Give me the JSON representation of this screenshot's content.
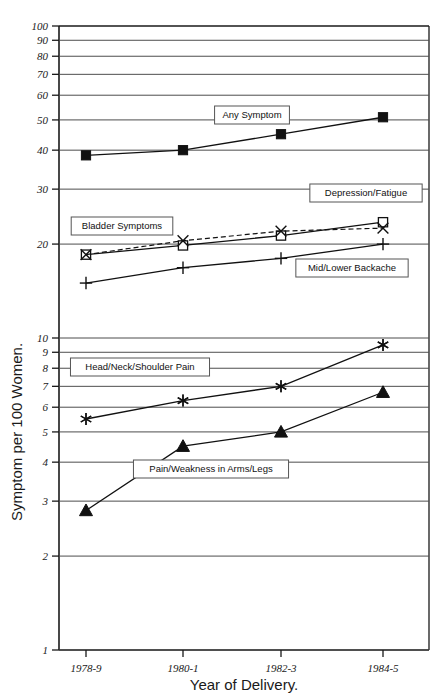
{
  "chart_data": {
    "type": "line",
    "title": "",
    "xlabel": "Year of Delivery.",
    "ylabel": "Symptom per 100 Women.",
    "yscale": "log",
    "ylim": [
      1,
      100
    ],
    "ytick_labels": [
      "100",
      "90",
      "80",
      "70",
      "60",
      "50",
      "40",
      "30",
      "20",
      "10",
      "9",
      "8",
      "7",
      "6",
      "5",
      "4",
      "3",
      "2",
      "1"
    ],
    "ytick_values": [
      100,
      90,
      80,
      70,
      60,
      50,
      40,
      30,
      20,
      10,
      9,
      8,
      7,
      6,
      5,
      4,
      3,
      2,
      1
    ],
    "grid": true,
    "legend_position": "inline-callouts",
    "categories": [
      "1978-9",
      "1980-1",
      "1982-3",
      "1984-5"
    ],
    "x": [
      "1978-9",
      "1980-1",
      "1982-3",
      "1984-5"
    ],
    "series": [
      {
        "name": "Any Symptom",
        "marker": "filled-square",
        "linestyle": "solid",
        "values": [
          38.5,
          40,
          45,
          51
        ]
      },
      {
        "name": "Depression/Fatigue",
        "marker": "open-square",
        "linestyle": "solid",
        "values": [
          18.5,
          19.8,
          21.3,
          23.5
        ]
      },
      {
        "name": "Bladder Symptoms",
        "marker": "x-cross",
        "linestyle": "dashed",
        "values": [
          18.5,
          20.5,
          22.0,
          22.5
        ]
      },
      {
        "name": "Mid/Lower Backache",
        "marker": "plus",
        "linestyle": "solid",
        "values": [
          15.0,
          16.8,
          18.0,
          20.0
        ]
      },
      {
        "name": "Head/Neck/Shoulder Pain",
        "marker": "asterisk",
        "linestyle": "solid",
        "values": [
          5.5,
          6.3,
          7.0,
          9.5
        ]
      },
      {
        "name": "Pain/Weakness in Arms/Legs",
        "marker": "filled-triangle",
        "linestyle": "solid",
        "values": [
          2.8,
          4.5,
          5.0,
          6.7
        ]
      }
    ],
    "annotations": [
      {
        "text": "Any Symptom",
        "x": 252,
        "y": 115
      },
      {
        "text": "Depression/Fatigue",
        "x": 366,
        "y": 193
      },
      {
        "text": "Bladder Symptoms",
        "x": 122,
        "y": 226
      },
      {
        "text": "Mid/Lower Backache",
        "x": 352,
        "y": 268
      },
      {
        "text": "Head/Neck/Shoulder Pain",
        "x": 140,
        "y": 367
      },
      {
        "text": "Pain/Weakness in Arms/Legs",
        "x": 211,
        "y": 469
      }
    ]
  }
}
